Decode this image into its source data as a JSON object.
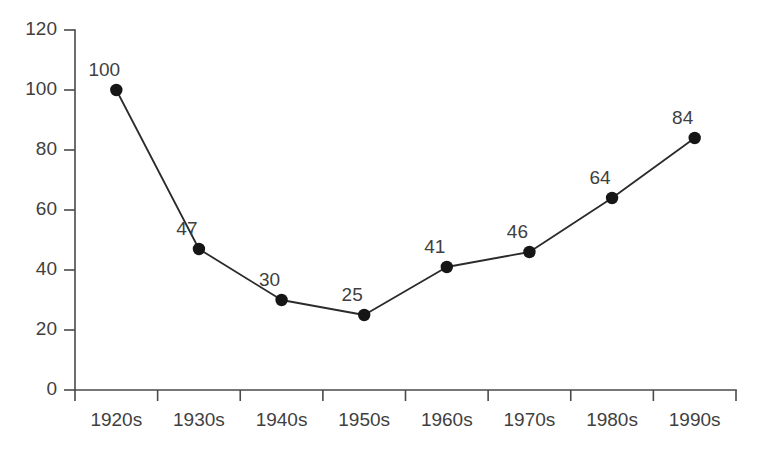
{
  "chart_data": {
    "type": "line",
    "title": "",
    "subtitle": "",
    "xlabel": "",
    "ylabel": "",
    "categories": [
      "1920s",
      "1930s",
      "1940s",
      "1950s",
      "1960s",
      "1970s",
      "1980s",
      "1990s"
    ],
    "values": [
      100,
      47,
      30,
      25,
      41,
      46,
      64,
      84
    ],
    "point_labels": [
      "100",
      "47",
      "30",
      "25",
      "41",
      "46",
      "64",
      "84"
    ],
    "series": [
      {
        "name": "",
        "values": [
          100,
          47,
          30,
          25,
          41,
          46,
          64,
          84
        ]
      }
    ],
    "ylim": [
      0,
      120
    ],
    "yticks": [
      0,
      20,
      40,
      60,
      80,
      100,
      120
    ],
    "ytick_labels": [
      "0",
      "20",
      "40",
      "60",
      "80",
      "100",
      "120"
    ],
    "xtick_labels": [
      "1920s",
      "1930s",
      "1940s",
      "1950s",
      "1960s",
      "1970s",
      "1980s",
      "1990s"
    ],
    "grid": false,
    "legend": false,
    "legend_position": "none",
    "marker": "circle",
    "colors": {
      "line": "#2b2b2b",
      "marker": "#161616",
      "axis": "#4a4a4a",
      "text": "#3f3f3f",
      "background": "#ffffff"
    }
  }
}
